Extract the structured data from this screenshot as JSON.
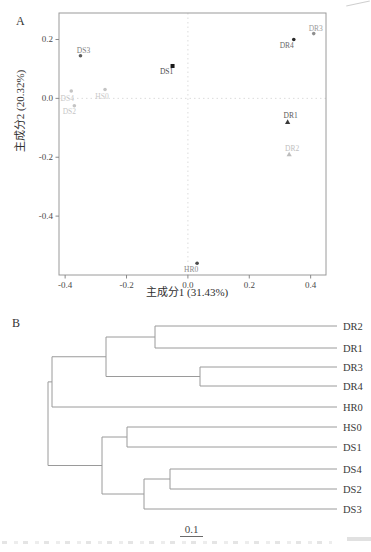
{
  "figure": {
    "panel_a_label": "A",
    "panel_b_label": "B"
  },
  "chart_data": [
    {
      "type": "scatter",
      "title": "PCA of samples",
      "xlabel": "主成分1 (31.43%)",
      "ylabel": "主成分2 (20.32%)",
      "xlim": [
        -0.42,
        0.45
      ],
      "ylim": [
        -0.6,
        0.29
      ],
      "x_ticks": [
        -0.4,
        -0.2,
        0.0,
        0.2,
        0.4
      ],
      "y_ticks": [
        0.2,
        0.0,
        -0.2,
        -0.4
      ],
      "grid": "dotted lines at x=0 and y=0",
      "border_color": "#9a9a9a",
      "zero_line_color": "#dcdcdc",
      "points": [
        {
          "label": "DS3",
          "x": -0.35,
          "y": 0.145,
          "marker": "circle",
          "marker_color": "#5f5f5f",
          "label_color": "#7e7e7e",
          "label_dx": 3,
          "label_dy": -5
        },
        {
          "label": "DS1",
          "x": -0.05,
          "y": 0.11,
          "marker": "square",
          "marker_color": "#1a1a1a",
          "label_color": "#4d4d4d",
          "label_dx": -6,
          "label_dy": 6
        },
        {
          "label": "DS4",
          "x": -0.38,
          "y": 0.025,
          "marker": "circle",
          "marker_color": "#c4c4c4",
          "label_color": "#c6c6c6",
          "label_dx": -4,
          "label_dy": 7
        },
        {
          "label": "HS0",
          "x": -0.27,
          "y": 0.03,
          "marker": "circle",
          "marker_color": "#c4c4c4",
          "label_color": "#c9c9c9",
          "label_dx": -3,
          "label_dy": 7
        },
        {
          "label": "DS2",
          "x": -0.37,
          "y": -0.025,
          "marker": "circle",
          "marker_color": "#c4c4c4",
          "label_color": "#c6c6c6",
          "label_dx": -5,
          "label_dy": 6
        },
        {
          "label": "DR4",
          "x": 0.345,
          "y": 0.2,
          "marker": "circle",
          "marker_color": "#2a2a2a",
          "label_color": "#6a6a6a",
          "label_dx": -7,
          "label_dy": 6
        },
        {
          "label": "DR3",
          "x": 0.41,
          "y": 0.22,
          "marker": "circle",
          "marker_color": "#8f8f8f",
          "label_color": "#9c9c9c",
          "label_dx": 2,
          "label_dy": -5
        },
        {
          "label": "DR1",
          "x": 0.325,
          "y": -0.08,
          "marker": "triangle",
          "marker_color": "#3a3a3a",
          "label_color": "#5a5a5a",
          "label_dx": 3,
          "label_dy": -6
        },
        {
          "label": "DR2",
          "x": 0.33,
          "y": -0.19,
          "marker": "triangle",
          "marker_color": "#bdbdbd",
          "label_color": "#c0c0c0",
          "label_dx": 3,
          "label_dy": -6
        },
        {
          "label": "HR0",
          "x": 0.03,
          "y": -0.56,
          "marker": "circle",
          "marker_color": "#4a4a4a",
          "label_color": "#8a8a8a",
          "label_dx": -6,
          "label_dy": 6
        }
      ]
    },
    {
      "type": "dendrogram",
      "orientation": "right",
      "line_color": "#9a9a9a",
      "label_color": "#3a3a3a",
      "scale_bar": {
        "label": "0.1",
        "length_units": 0.1
      },
      "leaf_order": [
        "DR2",
        "DR1",
        "DR3",
        "DR4",
        "HR0",
        "HS0",
        "DS1",
        "DS4",
        "DS2",
        "DS3"
      ],
      "tree": {
        "h": 1.445,
        "children": [
          {
            "h": 1.425,
            "children": [
              {
                "h": 1.155,
                "children": [
                  {
                    "h": 0.91,
                    "children": [
                      {
                        "leaf": "DR2"
                      },
                      {
                        "leaf": "DR1"
                      }
                    ]
                  },
                  {
                    "h": 0.685,
                    "children": [
                      {
                        "leaf": "DR3"
                      },
                      {
                        "leaf": "DR4"
                      }
                    ]
                  }
                ]
              },
              {
                "leaf": "HR0"
              }
            ]
          },
          {
            "h": 1.175,
            "children": [
              {
                "h": 1.05,
                "children": [
                  {
                    "leaf": "HS0"
                  },
                  {
                    "leaf": "DS1"
                  }
                ]
              },
              {
                "h": 0.965,
                "children": [
                  {
                    "h": 0.835,
                    "children": [
                      {
                        "leaf": "DS4"
                      },
                      {
                        "leaf": "DS2"
                      }
                    ]
                  },
                  {
                    "leaf": "DS3"
                  }
                ]
              }
            ]
          }
        ]
      }
    }
  ]
}
